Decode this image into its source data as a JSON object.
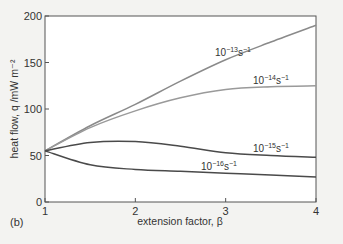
{
  "chart_data": {
    "type": "line",
    "title": "",
    "panel_label": "(b)",
    "xlabel": "extension factor, β",
    "ylabel": "heat flow, q /mW m⁻²",
    "xlim": [
      1,
      4
    ],
    "ylim": [
      0,
      200
    ],
    "x_ticks": [
      1,
      2,
      3,
      4
    ],
    "y_ticks": [
      0,
      50,
      100,
      150,
      200
    ],
    "grid": false,
    "legend": "inline labels",
    "x": [
      1,
      1.5,
      2,
      2.5,
      3,
      3.5,
      4
    ],
    "series": [
      {
        "name": "10^-13 s^-1",
        "label_base": "10",
        "label_exp": "−13",
        "label_unit": "s",
        "label_unit_exp": "−1",
        "color": "#8a8a8a",
        "values": [
          55,
          82,
          105,
          130,
          153,
          172,
          190
        ],
        "label_pos": [
          215,
          56
        ]
      },
      {
        "name": "10^-14 s^-1",
        "label_base": "10",
        "label_exp": "−14",
        "label_unit": "s",
        "label_unit_exp": "−1",
        "color": "#9a9a9a",
        "values": [
          55,
          80,
          98,
          112,
          121,
          124,
          125
        ],
        "label_pos": [
          253,
          84
        ]
      },
      {
        "name": "10^-15 s^-1",
        "label_base": "10",
        "label_exp": "−15",
        "label_unit": "s",
        "label_unit_exp": "−1",
        "color": "#4a4a4a",
        "values": [
          55,
          64,
          65,
          60,
          53,
          50,
          48
        ],
        "label_pos": [
          253,
          152
        ]
      },
      {
        "name": "10^-16 s^-1",
        "label_base": "10",
        "label_exp": "−16",
        "label_unit": "s",
        "label_unit_exp": "−1",
        "color": "#4a4a4a",
        "values": [
          55,
          40,
          35,
          33,
          31,
          29,
          27
        ],
        "label_pos": [
          201,
          170
        ]
      }
    ]
  }
}
